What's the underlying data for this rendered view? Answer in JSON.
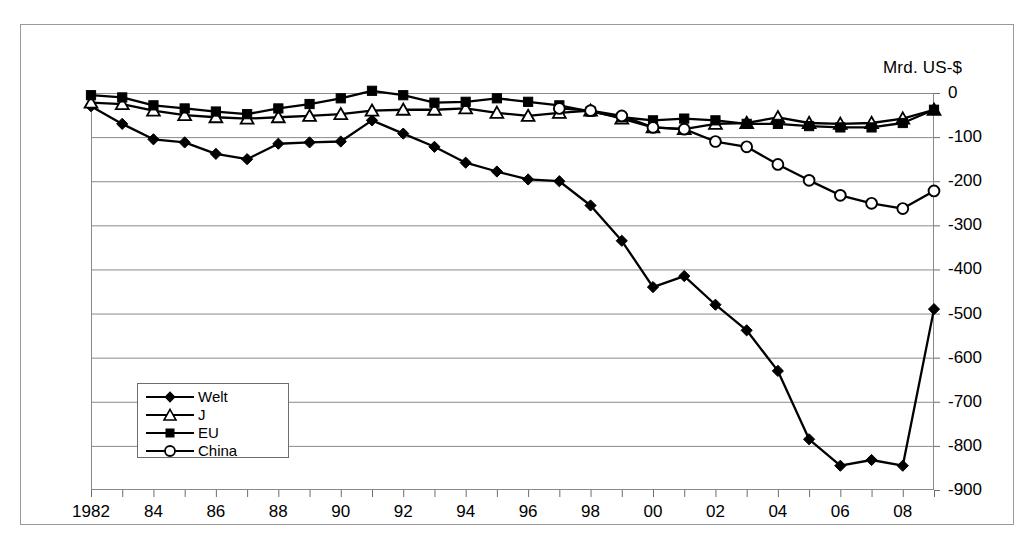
{
  "chart_data": {
    "type": "line",
    "title": "",
    "unit_label": "Mrd. US-$",
    "xlabel": "",
    "ylabel": "",
    "ylim": [
      -900,
      0
    ],
    "y_ticks": [
      0,
      -100,
      -200,
      -300,
      -400,
      -500,
      -600,
      -700,
      -800,
      -900
    ],
    "y_tick_labels": [
      "0",
      "-100",
      "-200",
      "-300",
      "-400",
      "-500",
      "-600",
      "-700",
      "-800",
      "-900"
    ],
    "grid": true,
    "legend_position": "inside-lower-left",
    "x": [
      1982,
      1983,
      1984,
      1985,
      1986,
      1987,
      1988,
      1989,
      1990,
      1991,
      1992,
      1993,
      1994,
      1995,
      1996,
      1997,
      1998,
      1999,
      2000,
      2001,
      2002,
      2003,
      2004,
      2005,
      2006,
      2007,
      2008,
      2009
    ],
    "x_tick_labels": [
      "1982",
      "",
      "84",
      "",
      "86",
      "",
      "88",
      "",
      "90",
      "",
      "92",
      "",
      "94",
      "",
      "96",
      "",
      "98",
      "",
      "00",
      "",
      "02",
      "",
      "04",
      "",
      "06",
      "",
      "08",
      ""
    ],
    "series": [
      {
        "name": "Welt",
        "marker": "filled-diamond",
        "color": "#000000",
        "values": [
          -30,
          -70,
          -105,
          -112,
          -138,
          -150,
          -115,
          -112,
          -110,
          -62,
          -92,
          -122,
          -158,
          -178,
          -196,
          -200,
          -255,
          -335,
          -440,
          -415,
          -480,
          -538,
          -630,
          -785,
          -845,
          -832,
          -845,
          -490
        ]
      },
      {
        "name": "J",
        "marker": "open-triangle",
        "color": "#000000",
        "values": [
          -22,
          -25,
          -40,
          -50,
          -55,
          -58,
          -55,
          -52,
          -48,
          -40,
          -38,
          -38,
          -35,
          -45,
          -52,
          -45,
          -40,
          -58,
          -78,
          -82,
          -70,
          -68,
          -55,
          -68,
          -70,
          -68,
          -58,
          -38
        ]
      },
      {
        "name": "EU",
        "marker": "filled-square",
        "color": "#000000",
        "values": [
          -5,
          -10,
          -28,
          -35,
          -42,
          -48,
          -35,
          -25,
          -12,
          5,
          -5,
          -22,
          -20,
          -12,
          -20,
          -28,
          -42,
          -55,
          -62,
          -58,
          -62,
          -70,
          -70,
          -75,
          -78,
          -78,
          -68,
          -38
        ]
      },
      {
        "name": "China",
        "marker": "open-circle",
        "color": "#000000",
        "values": [
          null,
          null,
          null,
          null,
          null,
          null,
          null,
          null,
          null,
          null,
          null,
          null,
          null,
          null,
          null,
          -35,
          -40,
          -52,
          -78,
          -82,
          -110,
          -122,
          -162,
          -198,
          -232,
          -250,
          -262,
          -222
        ]
      }
    ]
  },
  "legend": {
    "items": [
      {
        "label": "Welt",
        "marker": "filled-diamond"
      },
      {
        "label": "J",
        "marker": "open-triangle"
      },
      {
        "label": "EU",
        "marker": "filled-square"
      },
      {
        "label": "China",
        "marker": "open-circle"
      }
    ]
  }
}
